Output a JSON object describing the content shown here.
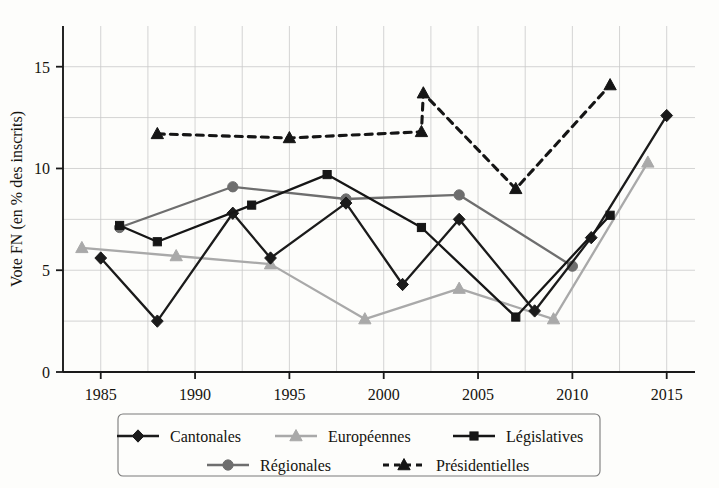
{
  "chart_data": {
    "type": "line",
    "title": "",
    "xlabel": "",
    "ylabel": "Vote FN (en % des inscrits)",
    "xlim": [
      1983,
      2016.5
    ],
    "ylim": [
      0,
      17
    ],
    "xticks": [
      1985,
      1990,
      1995,
      2000,
      2005,
      2010,
      2015
    ],
    "xtick_labels": [
      "1985",
      "1990",
      "1995",
      "2000",
      "2005",
      "2010",
      "2015"
    ],
    "yticks": [
      0,
      5,
      10,
      15
    ],
    "ytick_labels": [
      "0",
      "5",
      "10",
      "15"
    ],
    "grid": true,
    "grid_minor_x": [
      1985,
      1987.5,
      1990,
      1992.5,
      1995,
      1997.5,
      2000,
      2002.5,
      2005,
      2007.5,
      2010,
      2012.5,
      2015
    ],
    "grid_minor_y": [
      0,
      2.5,
      5,
      7.5,
      10,
      12.5,
      15
    ],
    "legend_position": "below",
    "series": [
      {
        "name": "Cantonales",
        "marker": "diamond",
        "color": "#1b1b1b",
        "dash": "solid",
        "points": [
          {
            "x": 1985,
            "y": 5.6
          },
          {
            "x": 1988,
            "y": 2.5
          },
          {
            "x": 1992,
            "y": 7.8
          },
          {
            "x": 1994,
            "y": 5.6
          },
          {
            "x": 1998,
            "y": 8.3
          },
          {
            "x": 2001,
            "y": 4.3
          },
          {
            "x": 2004,
            "y": 7.5
          },
          {
            "x": 2008,
            "y": 3.0
          },
          {
            "x": 2011,
            "y": 6.6
          },
          {
            "x": 2015,
            "y": 12.6
          }
        ]
      },
      {
        "name": "Européennes",
        "marker": "triangle",
        "color": "#a9a9a9",
        "dash": "solid",
        "points": [
          {
            "x": 1984,
            "y": 6.1
          },
          {
            "x": 1989,
            "y": 5.7
          },
          {
            "x": 1994,
            "y": 5.3
          },
          {
            "x": 1999,
            "y": 2.6
          },
          {
            "x": 2004,
            "y": 4.1
          },
          {
            "x": 2009,
            "y": 2.6
          },
          {
            "x": 2014,
            "y": 10.3
          }
        ]
      },
      {
        "name": "Législatives",
        "marker": "square",
        "color": "#161616",
        "dash": "solid",
        "points": [
          {
            "x": 1986,
            "y": 7.2
          },
          {
            "x": 1988,
            "y": 6.4
          },
          {
            "x": 1993,
            "y": 8.2
          },
          {
            "x": 1997,
            "y": 9.7
          },
          {
            "x": 2002,
            "y": 7.1
          },
          {
            "x": 2007,
            "y": 2.7
          },
          {
            "x": 2012,
            "y": 7.7
          }
        ]
      },
      {
        "name": "Régionales",
        "marker": "circle",
        "color": "#6e6e6e",
        "dash": "solid",
        "points": [
          {
            "x": 1986,
            "y": 7.1
          },
          {
            "x": 1992,
            "y": 9.1
          },
          {
            "x": 1998,
            "y": 8.5
          },
          {
            "x": 2004,
            "y": 8.7
          },
          {
            "x": 2010,
            "y": 5.2
          }
        ]
      },
      {
        "name": "Présidentielles",
        "marker": "triangle",
        "color": "#151515",
        "dash": "dashed",
        "points": [
          {
            "x": 1988,
            "y": 11.7
          },
          {
            "x": 1995,
            "y": 11.5
          },
          {
            "x": 2002,
            "y": 11.8
          },
          {
            "x": 2002.1,
            "y": 13.7
          },
          {
            "x": 2007,
            "y": 9.0
          },
          {
            "x": 2012,
            "y": 14.1
          }
        ]
      }
    ],
    "legend": [
      {
        "label": "Cantonales",
        "marker": "diamond",
        "color": "#1b1b1b",
        "dash": "solid"
      },
      {
        "label": "Européennes",
        "marker": "triangle",
        "color": "#a9a9a9",
        "dash": "solid"
      },
      {
        "label": "Législatives",
        "marker": "square",
        "color": "#161616",
        "dash": "solid"
      },
      {
        "label": "Régionales",
        "marker": "circle",
        "color": "#6e6e6e",
        "dash": "solid"
      },
      {
        "label": "Présidentielles",
        "marker": "triangle",
        "color": "#151515",
        "dash": "dashed"
      }
    ],
    "colors": {
      "axis": "#1a1a1a",
      "grid": "#c9c9c9",
      "background": "#fdfdfb"
    }
  }
}
